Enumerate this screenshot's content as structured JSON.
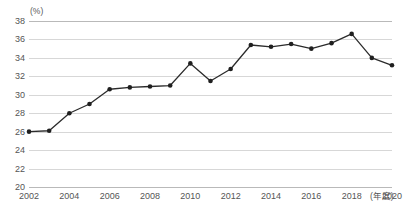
{
  "chart": {
    "title": "",
    "unit_label": "(%)",
    "xaxis_unit": "(年度)"
  },
  "chart_data": {
    "type": "line",
    "title": "",
    "xlabel": "(年度)",
    "ylabel": "(%)",
    "ylim": [
      20,
      38
    ],
    "ytick_step": 2,
    "yticks": [
      38,
      36,
      34,
      32,
      30,
      28,
      26,
      24,
      22,
      20
    ],
    "xticks": [
      2002,
      2004,
      2006,
      2008,
      2010,
      2012,
      2014,
      2016,
      2018,
      2020
    ],
    "x": [
      2002,
      2003,
      2004,
      2005,
      2006,
      2007,
      2008,
      2009,
      2010,
      2011,
      2012,
      2013,
      2014,
      2015,
      2016,
      2017,
      2018,
      2019,
      2020
    ],
    "values": [
      26.0,
      26.1,
      28.0,
      29.0,
      30.6,
      30.8,
      30.9,
      31.0,
      33.4,
      31.5,
      32.8,
      35.4,
      35.2,
      35.5,
      35.0,
      35.6,
      36.6,
      34.0,
      33.2
    ],
    "series": [
      {
        "name": "",
        "values": [
          26.0,
          26.1,
          28.0,
          29.0,
          30.6,
          30.8,
          30.9,
          31.0,
          33.4,
          31.5,
          32.8,
          35.4,
          35.2,
          35.5,
          35.0,
          35.6,
          36.6,
          34.0,
          33.2
        ]
      }
    ],
    "grid": true,
    "legend": false,
    "marker": "circle",
    "line_color": "#2b2b2b",
    "grid_color": "#d7d7d7"
  }
}
